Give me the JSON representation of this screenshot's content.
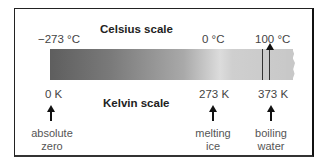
{
  "celsius": {
    "title": "Celsius scale",
    "ticks": [
      "−273 °C",
      "0 °C",
      "100 °C"
    ]
  },
  "kelvin": {
    "title": "Kelvin scale",
    "ticks": [
      "0 K",
      "273 K",
      "373 K"
    ]
  },
  "annotations": [
    {
      "line1": "absolute",
      "line2": "zero"
    },
    {
      "line1": "melting",
      "line2": "ice"
    },
    {
      "line1": "boiling",
      "line2": "water"
    }
  ]
}
